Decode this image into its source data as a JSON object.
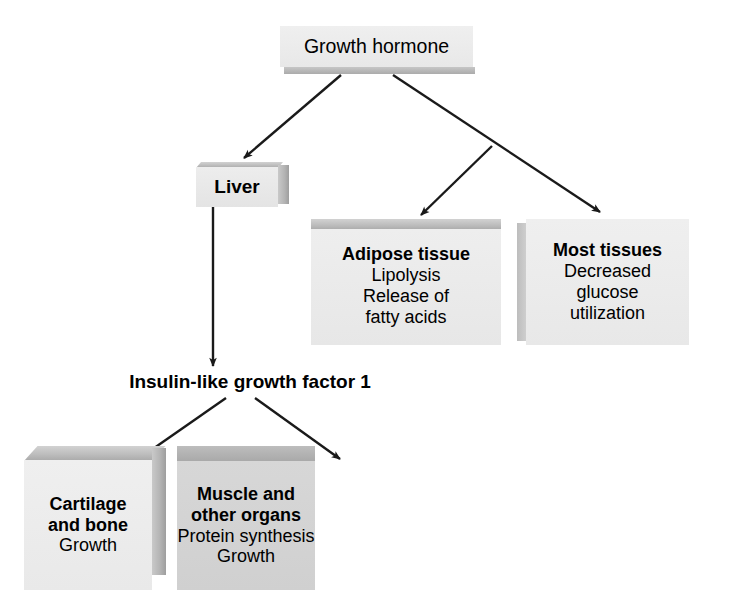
{
  "diagram": {
    "background_color": "#ffffff",
    "line_color": "#1a1a1a"
  },
  "nodes": {
    "growth_hormone": {
      "label": "Growth hormone"
    },
    "liver": {
      "label": "Liver"
    },
    "adipose": {
      "title": "Adipose tissue",
      "effect_1": "Lipolysis",
      "effect_2": "Release of",
      "effect_3": "fatty acids"
    },
    "most_tissues": {
      "title": "Most tissues",
      "effect_1": "Decreased",
      "effect_2": "glucose",
      "effect_3": "utilization"
    },
    "igf1": {
      "label": "Insulin-like growth factor 1"
    },
    "cartilage": {
      "title_1": "Cartilage",
      "title_2": "and bone",
      "effect_1": "Growth"
    },
    "muscle": {
      "title_1": "Muscle and",
      "title_2": "other organs",
      "effect_1": "Protein synthesis",
      "effect_2": "Growth"
    }
  },
  "edges": [
    {
      "name": "gh-to-liver",
      "from": "growth_hormone",
      "to": "liver"
    },
    {
      "name": "gh-to-most-tissues",
      "from": "growth_hormone",
      "to": "most_tissues"
    },
    {
      "name": "gh-to-adipose",
      "from": "growth_hormone",
      "to": "adipose"
    },
    {
      "name": "liver-to-igf1",
      "from": "liver",
      "to": "igf1"
    },
    {
      "name": "igf1-to-cartilage",
      "from": "igf1",
      "to": "cartilage"
    },
    {
      "name": "igf1-to-muscle",
      "from": "igf1",
      "to": "muscle"
    }
  ]
}
